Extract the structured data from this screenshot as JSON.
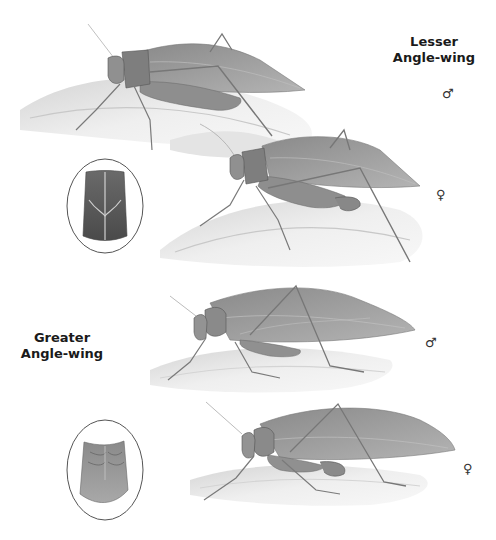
{
  "plate": {
    "species": [
      {
        "id": "lesser",
        "name_line1": "Lesser",
        "name_line2": "Angle-wing",
        "figures": [
          {
            "sex": "male",
            "symbol": "♂"
          },
          {
            "sex": "female",
            "symbol": "♀"
          }
        ],
        "inset": "pronotum-detail"
      },
      {
        "id": "greater",
        "name_line1": "Greater",
        "name_line2": "Angle-wing",
        "figures": [
          {
            "sex": "male",
            "symbol": "♂"
          },
          {
            "sex": "female",
            "symbol": "♀"
          }
        ],
        "inset": "pronotum-detail"
      }
    ]
  },
  "colors": {
    "insect_body": "#8c8c8c",
    "insect_wing": "#9a9a9a",
    "leaf": "#e6e6e6",
    "leaf_shadow": "#cfcfcf",
    "inset_border": "#555555",
    "label_text": "#1a1a1a"
  }
}
